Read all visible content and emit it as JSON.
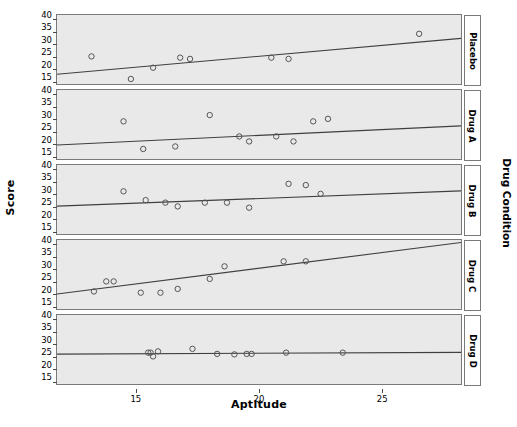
{
  "chart_data": {
    "type": "scatter",
    "title": "",
    "xlabel": "Aptitude",
    "ylabel": "Score",
    "panel_group_label": "Drug Condition",
    "xlim": [
      11.8,
      28.2
    ],
    "ylim": [
      14.0,
      41.5
    ],
    "xticks": [
      15,
      20,
      25
    ],
    "yticks": [
      15,
      20,
      25,
      30,
      35,
      40
    ],
    "grid": false,
    "legend": "none",
    "marker": "open-circle",
    "fit_line": "linear regression",
    "panels": [
      {
        "label": "Placebo",
        "x": [
          13.2,
          14.8,
          15.7,
          16.8,
          17.2,
          20.5,
          21.2,
          26.5
        ],
        "y": [
          25.0,
          16.0,
          20.5,
          24.5,
          24.0,
          24.5,
          24.0,
          34.0
        ],
        "fit": {
          "x0": 11.8,
          "y0": 17.9,
          "x1": 28.2,
          "y1": 32.2
        }
      },
      {
        "label": "Drug A",
        "x": [
          14.5,
          15.3,
          16.6,
          18.0,
          19.2,
          19.6,
          20.7,
          21.4,
          22.2,
          22.8
        ],
        "y": [
          29.0,
          18.0,
          19.0,
          31.5,
          23.0,
          21.0,
          23.0,
          21.0,
          29.0,
          30.0
        ],
        "fit": {
          "x0": 11.8,
          "y0": 19.6,
          "x1": 28.2,
          "y1": 27.2
        }
      },
      {
        "label": "Drug B",
        "x": [
          14.5,
          15.4,
          16.2,
          16.7,
          17.8,
          18.7,
          19.6,
          21.2,
          21.9,
          22.5
        ],
        "y": [
          31.0,
          27.5,
          26.5,
          25.0,
          26.5,
          26.5,
          24.5,
          34.0,
          33.5,
          30.0
        ],
        "fit": {
          "x0": 11.8,
          "y0": 25.1,
          "x1": 28.2,
          "y1": 31.2
        }
      },
      {
        "label": "Drug C",
        "x": [
          13.3,
          13.8,
          14.1,
          15.2,
          16.0,
          16.7,
          18.0,
          18.6,
          21.0,
          21.9
        ],
        "y": [
          21.0,
          25.0,
          25.0,
          20.5,
          20.5,
          22.0,
          26.0,
          31.0,
          33.0,
          33.0
        ],
        "fit": {
          "x0": 11.8,
          "y0": 20.0,
          "x1": 28.2,
          "y1": 40.5
        }
      },
      {
        "label": "Drug D",
        "x": [
          15.5,
          15.6,
          15.7,
          15.9,
          17.3,
          18.3,
          19.0,
          19.5,
          19.7,
          21.1,
          23.4
        ],
        "y": [
          26.5,
          26.5,
          25.0,
          27.0,
          28.0,
          26.0,
          25.8,
          26.0,
          26.0,
          26.5,
          26.5
        ],
        "fit": {
          "x0": 11.8,
          "y0": 25.9,
          "x1": 28.2,
          "y1": 26.6
        }
      }
    ]
  },
  "colors": {
    "panel_background": "#e9e9e9",
    "panel_border": "#7a7a7a",
    "marker_stroke": "#555555",
    "fit_line": "#3f3f3f",
    "strip_background": "#ffffff",
    "text": "#000000"
  }
}
